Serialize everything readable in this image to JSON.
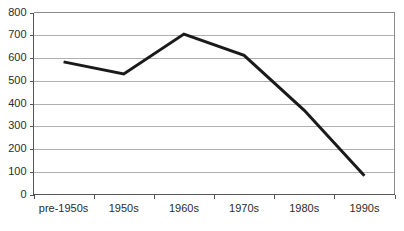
{
  "chart_data": {
    "type": "line",
    "title": "",
    "subtitle": "",
    "xlabel": "",
    "ylabel": "",
    "categories": [
      "pre-1950s",
      "1950s",
      "1960s",
      "1970s",
      "1980s",
      "1990s"
    ],
    "series": [
      {
        "name": "series-1",
        "values": [
          583,
          530,
          705,
          612,
          370,
          82
        ],
        "color": "#1a1a1a",
        "line_width": 3,
        "markers": "none"
      }
    ],
    "values": [
      583,
      530,
      705,
      612,
      370,
      82
    ],
    "ylim": [
      0,
      800
    ],
    "ytick_values": [
      0,
      100,
      200,
      300,
      400,
      500,
      600,
      700,
      800
    ],
    "ytick_labels": [
      "0",
      "100",
      "200",
      "300",
      "400",
      "500",
      "600",
      "700",
      "800"
    ],
    "xtick_labels": [
      "pre-1950s",
      "1950s",
      "1960s",
      "1970s",
      "1980s",
      "1990s"
    ],
    "grid": "horizontal",
    "grid_color": "#b0b0b0",
    "legend": "none",
    "legend_position": "none",
    "annotations": [],
    "plot_background": "#ffffff",
    "frame_color": "#8a8a8a",
    "axis_color": "#555555"
  },
  "axes": {
    "y": {
      "ticks": [
        {
          "label": "800",
          "value": 800
        },
        {
          "label": "700",
          "value": 700
        },
        {
          "label": "600",
          "value": 600
        },
        {
          "label": "500",
          "value": 500
        },
        {
          "label": "400",
          "value": 400
        },
        {
          "label": "300",
          "value": 300
        },
        {
          "label": "200",
          "value": 200
        },
        {
          "label": "100",
          "value": 100
        },
        {
          "label": "0",
          "value": 0
        }
      ]
    },
    "x": {
      "ticks": [
        {
          "label": "pre-1950s"
        },
        {
          "label": "1950s"
        },
        {
          "label": "1960s"
        },
        {
          "label": "1970s"
        },
        {
          "label": "1980s"
        },
        {
          "label": "1990s"
        }
      ]
    }
  }
}
